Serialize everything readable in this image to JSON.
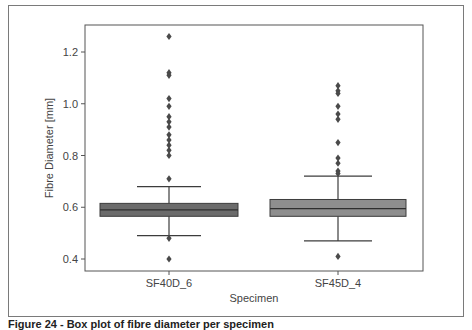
{
  "figure": {
    "caption": "Figure 24 - Box plot of fibre diameter per specimen"
  },
  "chart_data": {
    "type": "box",
    "title": "",
    "xlabel": "Specimen",
    "ylabel": "Fibre Diameter [mm]",
    "categories": [
      "SF40D_6",
      "SF45D_4"
    ],
    "ylim": [
      0.36,
      1.31
    ],
    "yticks": [
      0.4,
      0.6,
      0.8,
      1.0,
      1.2
    ],
    "ytick_labels": [
      "0.4",
      "0.6",
      "0.8",
      "1.0",
      "1.2"
    ],
    "grid": false,
    "legend": null,
    "series": [
      {
        "name": "SF40D_6",
        "color": "#6b6b6b",
        "q1": 0.565,
        "median": 0.59,
        "q3": 0.615,
        "whisker_low": 0.49,
        "whisker_high": 0.68,
        "outliers": [
          1.26,
          1.12,
          1.11,
          1.02,
          0.99,
          0.95,
          0.93,
          0.91,
          0.88,
          0.86,
          0.84,
          0.82,
          0.8,
          0.71,
          0.48,
          0.4
        ]
      },
      {
        "name": "SF45D_4",
        "color": "#8e8e8e",
        "q1": 0.565,
        "median": 0.595,
        "q3": 0.63,
        "whisker_low": 0.47,
        "whisker_high": 0.72,
        "outliers": [
          1.07,
          1.05,
          1.04,
          0.99,
          0.96,
          0.94,
          0.85,
          0.79,
          0.77,
          0.74,
          0.73,
          0.41
        ]
      }
    ]
  }
}
